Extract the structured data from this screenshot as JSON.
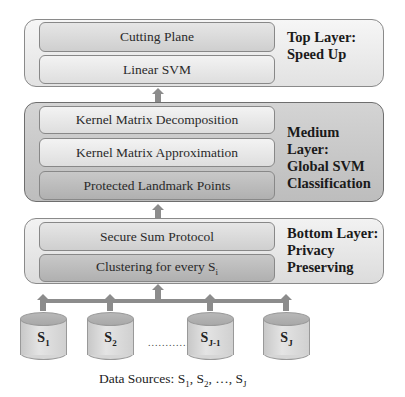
{
  "layers": {
    "top": {
      "title_line1": "Top Layer:",
      "title_line2": "Speed Up",
      "boxes": [
        "Cutting Plane",
        "Linear SVM"
      ]
    },
    "medium": {
      "title_line1": "Medium Layer:",
      "title_line2": "Global SVM",
      "title_line3": "Classification",
      "boxes": [
        "Kernel Matrix Decomposition",
        "Kernel Matrix Approximation",
        "Protected Landmark Points"
      ]
    },
    "bottom": {
      "title_line1": "Bottom Layer:",
      "title_line2": "Privacy",
      "title_line3": "Preserving",
      "boxes": [
        "Secure Sum Protocol",
        "Clustering for every S",
        "i"
      ]
    }
  },
  "sources": [
    {
      "base": "S",
      "sub": "1"
    },
    {
      "base": "S",
      "sub": "2"
    },
    {
      "base": "S",
      "sub": "J-1"
    },
    {
      "base": "S",
      "sub": "J"
    }
  ],
  "ellipsis": "............",
  "caption": {
    "prefix": "Data Sources: S",
    "s1_sub": "1",
    "sep1": ", S",
    "s2_sub": "2",
    "sep2": ", …, S",
    "sj_sub": "J"
  },
  "colors": {
    "arrow": "#8c8c8c",
    "border": "#8a8a8a",
    "medium_layer_bg": "#c8c8c8"
  }
}
